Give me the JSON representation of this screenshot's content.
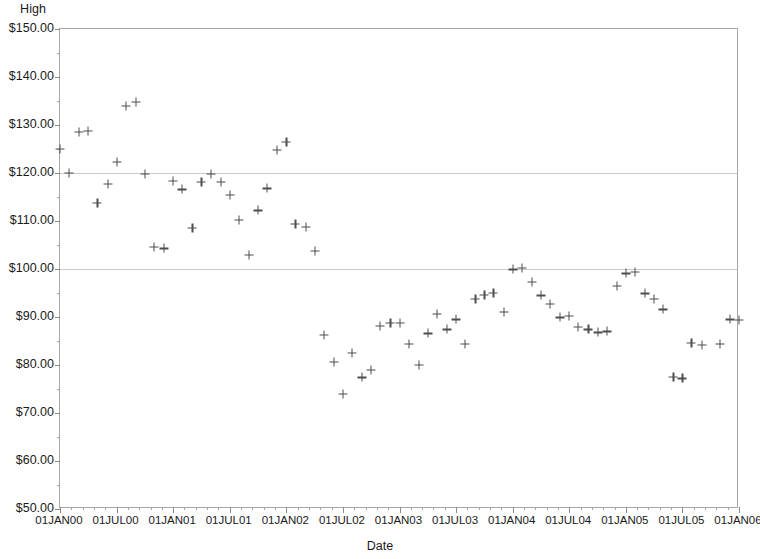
{
  "chart_data": {
    "type": "scatter",
    "title": "",
    "ylabel": "High",
    "xlabel": "Date",
    "ylim": [
      50,
      150
    ],
    "xlim": [
      "01JAN00",
      "01JAN06"
    ],
    "grid": true,
    "gridlines_at": [
      100,
      120
    ],
    "legend": null,
    "marker": "plus",
    "marker_color": "#4d4d52",
    "y_tick_labels": [
      "$50.00",
      "$60.00",
      "$70.00",
      "$80.00",
      "$90.00",
      "$100.00",
      "$110.00",
      "$120.00",
      "$130.00",
      "$140.00",
      "$150.00"
    ],
    "y_tick_values": [
      50,
      60,
      70,
      80,
      90,
      100,
      110,
      120,
      130,
      140,
      150
    ],
    "x_tick_labels": [
      "01JAN00",
      "01JUL00",
      "01JAN01",
      "01JUL01",
      "01JAN02",
      "01JUL02",
      "01JAN03",
      "01JUL03",
      "01JAN04",
      "01JUL04",
      "01JAN05",
      "01JUL05",
      "01JAN06"
    ],
    "x_tick_values": [
      0,
      0.5,
      1,
      1.5,
      2,
      2.5,
      3,
      3.5,
      4,
      4.5,
      5,
      5.5,
      6
    ],
    "x_unit": "years since 01JAN00",
    "points": [
      {
        "x": 0.0,
        "y": 125.0
      },
      {
        "x": 0.08,
        "y": 120.0
      },
      {
        "x": 0.17,
        "y": 128.5
      },
      {
        "x": 0.25,
        "y": 128.7
      },
      {
        "x": 0.33,
        "y": 113.8
      },
      {
        "x": 0.42,
        "y": 117.8
      },
      {
        "x": 0.5,
        "y": 122.3
      },
      {
        "x": 0.58,
        "y": 134.0
      },
      {
        "x": 0.67,
        "y": 134.8
      },
      {
        "x": 0.75,
        "y": 119.8
      },
      {
        "x": 0.83,
        "y": 104.6
      },
      {
        "x": 0.92,
        "y": 104.3
      },
      {
        "x": 1.0,
        "y": 118.3
      },
      {
        "x": 1.08,
        "y": 116.6
      },
      {
        "x": 1.17,
        "y": 108.6
      },
      {
        "x": 1.25,
        "y": 118.1
      },
      {
        "x": 1.33,
        "y": 119.8
      },
      {
        "x": 1.42,
        "y": 118.2
      },
      {
        "x": 1.5,
        "y": 115.4
      },
      {
        "x": 1.58,
        "y": 110.2
      },
      {
        "x": 1.67,
        "y": 103.0
      },
      {
        "x": 1.75,
        "y": 112.2
      },
      {
        "x": 1.83,
        "y": 116.8
      },
      {
        "x": 1.92,
        "y": 124.8
      },
      {
        "x": 2.0,
        "y": 126.4
      },
      {
        "x": 2.08,
        "y": 109.4
      },
      {
        "x": 2.17,
        "y": 108.8
      },
      {
        "x": 2.25,
        "y": 103.8
      },
      {
        "x": 2.33,
        "y": 86.3
      },
      {
        "x": 2.42,
        "y": 80.7
      },
      {
        "x": 2.5,
        "y": 74.0
      },
      {
        "x": 2.58,
        "y": 82.6
      },
      {
        "x": 2.67,
        "y": 77.4
      },
      {
        "x": 2.75,
        "y": 79.0
      },
      {
        "x": 2.83,
        "y": 88.1
      },
      {
        "x": 2.92,
        "y": 88.8
      },
      {
        "x": 3.0,
        "y": 88.7
      },
      {
        "x": 3.08,
        "y": 84.4
      },
      {
        "x": 3.17,
        "y": 80.0
      },
      {
        "x": 3.25,
        "y": 86.6
      },
      {
        "x": 3.33,
        "y": 90.6
      },
      {
        "x": 3.42,
        "y": 87.4
      },
      {
        "x": 3.5,
        "y": 89.5
      },
      {
        "x": 3.58,
        "y": 84.4
      },
      {
        "x": 3.67,
        "y": 93.8
      },
      {
        "x": 3.75,
        "y": 94.6
      },
      {
        "x": 3.83,
        "y": 95.0
      },
      {
        "x": 3.92,
        "y": 91.1
      },
      {
        "x": 4.0,
        "y": 99.9
      },
      {
        "x": 4.08,
        "y": 100.3
      },
      {
        "x": 4.17,
        "y": 97.3
      },
      {
        "x": 4.25,
        "y": 94.5
      },
      {
        "x": 4.33,
        "y": 92.8
      },
      {
        "x": 4.42,
        "y": 89.9
      },
      {
        "x": 4.5,
        "y": 90.2
      },
      {
        "x": 4.58,
        "y": 88.0
      },
      {
        "x": 4.67,
        "y": 87.4
      },
      {
        "x": 4.75,
        "y": 86.8
      },
      {
        "x": 4.83,
        "y": 87.0
      },
      {
        "x": 4.92,
        "y": 96.5
      },
      {
        "x": 5.0,
        "y": 99.1
      },
      {
        "x": 5.08,
        "y": 99.4
      },
      {
        "x": 5.17,
        "y": 94.9
      },
      {
        "x": 5.25,
        "y": 93.7
      },
      {
        "x": 5.33,
        "y": 91.6
      },
      {
        "x": 5.42,
        "y": 77.6
      },
      {
        "x": 5.5,
        "y": 77.2
      },
      {
        "x": 5.58,
        "y": 84.6
      },
      {
        "x": 5.67,
        "y": 84.2
      },
      {
        "x": 5.83,
        "y": 84.4
      },
      {
        "x": 5.92,
        "y": 89.5
      },
      {
        "x": 6.0,
        "y": 89.4
      }
    ]
  }
}
